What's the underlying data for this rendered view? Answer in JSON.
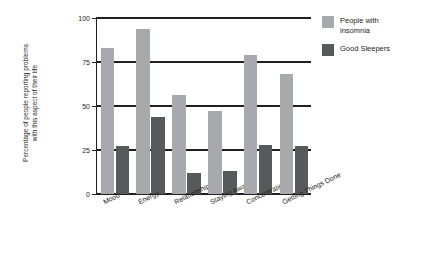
{
  "chart_data": {
    "type": "bar",
    "title": "",
    "xlabel": "",
    "ylabel": "Percentage of people reporting problems\nwith this aspect of their life",
    "ylim": [
      0,
      100
    ],
    "yticks": [
      0,
      25,
      50,
      75,
      100
    ],
    "ytick_labels": [
      "0",
      "25",
      "50",
      "75",
      "100"
    ],
    "grid": true,
    "legend_position": "top-right",
    "categories": [
      "Mood",
      "Energy",
      "Relationships",
      "Staying Awake",
      "Concentrations",
      "Getting Things Done"
    ],
    "series": [
      {
        "name": "People with insomnia",
        "color": "#a7a9ac",
        "values": [
          83,
          94,
          56,
          47,
          79,
          68
        ]
      },
      {
        "name": "Good Sleepers",
        "color": "#58595b",
        "values": [
          27,
          44,
          12,
          13,
          28,
          27
        ]
      }
    ]
  },
  "legend": {
    "items": [
      {
        "label": "People with\ninsomnia",
        "color": "#a7a9ac"
      },
      {
        "label": "Good Sleepers",
        "color": "#58595b"
      }
    ]
  }
}
